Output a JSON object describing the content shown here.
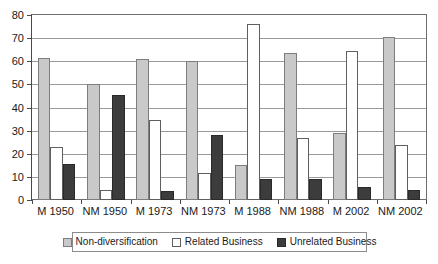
{
  "chart_data": {
    "type": "bar",
    "title": "",
    "xlabel": "",
    "ylabel": "",
    "ylim": [
      0,
      80
    ],
    "yticks": [
      0,
      10,
      20,
      30,
      40,
      50,
      60,
      70,
      80
    ],
    "grid": true,
    "legend_position": "bottom",
    "categories": [
      "M 1950",
      "NM 1950",
      "M 1973",
      "NM 1973",
      "M 1988",
      "NM 1988",
      "M 2002",
      "NM 2002"
    ],
    "series": [
      {
        "name": "Non-diversification",
        "color": "#c9c9c9",
        "values": [
          61.5,
          50,
          61,
          60,
          15,
          63.5,
          29,
          70.5
        ]
      },
      {
        "name": "Related Business",
        "color": "#ffffff",
        "values": [
          23,
          4.5,
          34.5,
          11.5,
          76,
          27,
          64.5,
          24
        ]
      },
      {
        "name": "Unrelated Business",
        "color": "#3c3c3c",
        "values": [
          15.5,
          45.5,
          4,
          28,
          9,
          9,
          5.5,
          4.5
        ]
      }
    ]
  },
  "legend": {
    "items": [
      {
        "label": "Non-diversification",
        "swatch": "s0"
      },
      {
        "label": "Related Business",
        "swatch": "s1"
      },
      {
        "label": "Unrelated Business",
        "swatch": "s2"
      }
    ]
  }
}
